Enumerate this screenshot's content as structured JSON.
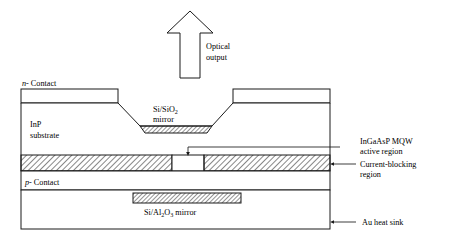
{
  "figure": {
    "background_color": "#ffffff",
    "line_color": "#1a1a1a",
    "hatch_color": "#1a1a1a"
  },
  "labels": {
    "optical_output_line1": "Optical",
    "optical_output_line2": "output",
    "n_contact_prefix": "n",
    "n_contact_suffix": "- Contact",
    "p_contact_prefix": "p",
    "p_contact_suffix": "- Contact",
    "inp_substrate_line1": "InP",
    "inp_substrate_line2": "substrate",
    "si_sio2_mirror_main": "Si/SiO",
    "si_sio2_mirror_sub": "2",
    "si_sio2_mirror_line2": "mirror",
    "si_al2o3_mirror_part1": "Si/Al",
    "si_al2o3_mirror_sub1": "2",
    "si_al2o3_mirror_part2": "O",
    "si_al2o3_mirror_sub2": "3",
    "si_al2o3_mirror_part3": " mirror",
    "mqw_line1": "InGaAsP MQW",
    "mqw_line2": "active region",
    "current_blocking_line1": "Current-blocking",
    "current_blocking_line2": "region",
    "au_heat_sink": "Au heat sink"
  },
  "icons": {
    "optical_output_arrow": "up-arrow-icon",
    "mqw_pointer": "down-arrow-icon",
    "current_blocking_pointer": "left-arrow-icon",
    "au_heat_sink_pointer": "left-arrow-icon"
  }
}
